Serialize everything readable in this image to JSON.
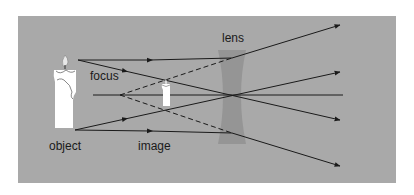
{
  "diagram": {
    "labels": {
      "lens": "lens",
      "focus": "focus",
      "object": "object",
      "image": "image"
    },
    "colors": {
      "background": "#a9a9a9",
      "ray": "#1a1a1a",
      "lens": "#8f8f8f",
      "candle": "#ffffff"
    }
  }
}
